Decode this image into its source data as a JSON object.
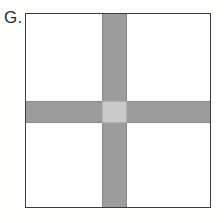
{
  "figure": {
    "label": "G.",
    "caption": "",
    "background_color": "#fdfdfc"
  },
  "shape": {
    "name": "square-with-crossing-bands",
    "outline_color": "#3b3b3b",
    "outline_width_px": 1.4,
    "fill_color": "#ffffff",
    "left_px": 25,
    "top_px": 13,
    "width_px": 186,
    "height_px": 195
  },
  "bands": {
    "band_color": "#9c9c9c",
    "band_edge_color": "#8a8a8a",
    "intersection_color": "#c9c9c9",
    "intersection_edge_color": "#b0b0b0",
    "vertical": {
      "name": "vertical-shaded-band",
      "orientation": "vertical",
      "x_start_px": 102,
      "x_end_px": 127,
      "thickness_px": 25,
      "spans": "full-height"
    },
    "horizontal": {
      "name": "horizontal-shaded-band",
      "orientation": "horizontal",
      "y_start_px": 101,
      "y_end_px": 123,
      "thickness_px": 22,
      "spans": "full-width"
    },
    "intersection": {
      "name": "band-intersection-square",
      "x_px": 102,
      "y_px": 101,
      "width_px": 25,
      "height_px": 22
    }
  },
  "quadrants": [
    {
      "name": "top-left-quadrant",
      "fill": "#ffffff"
    },
    {
      "name": "top-right-quadrant",
      "fill": "#ffffff"
    },
    {
      "name": "bottom-left-quadrant",
      "fill": "#ffffff"
    },
    {
      "name": "bottom-right-quadrant",
      "fill": "#ffffff"
    }
  ]
}
